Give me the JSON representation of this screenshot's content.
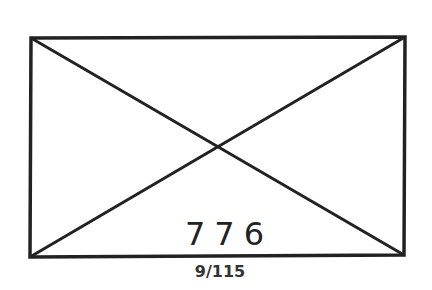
{
  "figure": {
    "shape": "rectangle-with-diagonals",
    "stroke_color": "#222222",
    "background": "#ffffff",
    "rectangle": {
      "top_left": [
        31,
        38
      ],
      "top_right": [
        405,
        37
      ],
      "bottom_right": [
        404,
        255
      ],
      "bottom_left": [
        30,
        257
      ]
    },
    "diagonals": [
      {
        "from": "top_left",
        "to": "bottom_right"
      },
      {
        "from": "top_right",
        "to": "bottom_left"
      }
    ],
    "intersection": [
      221,
      146
    ]
  },
  "labels": {
    "main_number": "776",
    "page_reference": "9/115"
  }
}
